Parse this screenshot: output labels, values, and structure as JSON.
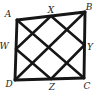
{
  "figure": {
    "kind": "geometry-diagram",
    "background_color": "#ffffff",
    "stroke_color": "#161616",
    "label_color": "#1c1c1c",
    "style": {
      "side_width": 2.9,
      "inner_width": 2.5
    },
    "points": {
      "A": {
        "label": "A",
        "x": 17,
        "y": 20,
        "label_x": 8,
        "label_y": 14
      },
      "B": {
        "label": "B",
        "x": 85,
        "y": 12,
        "label_x": 89,
        "label_y": 7
      },
      "C": {
        "label": "C",
        "x": 84,
        "y": 78,
        "label_x": 87,
        "label_y": 86
      },
      "D": {
        "label": "D",
        "x": 15,
        "y": 80,
        "label_x": 9,
        "label_y": 84
      },
      "X": {
        "label": "X",
        "x": 51,
        "y": 16,
        "label_x": 51,
        "label_y": 10
      },
      "Y": {
        "label": "Y",
        "x": 84.5,
        "y": 45,
        "label_x": 90,
        "label_y": 47
      },
      "Z": {
        "label": "Z",
        "x": 51,
        "y": 79,
        "label_x": 52,
        "label_y": 87
      },
      "W": {
        "label": "W",
        "x": 16,
        "y": 49,
        "label_x": 4,
        "label_y": 46
      }
    },
    "segments": [
      {
        "from": "A",
        "to": "B",
        "role": "side"
      },
      {
        "from": "B",
        "to": "C",
        "role": "side"
      },
      {
        "from": "C",
        "to": "D",
        "role": "side"
      },
      {
        "from": "D",
        "to": "A",
        "role": "side"
      },
      {
        "from": "A",
        "to": "C",
        "role": "diagonal"
      },
      {
        "from": "B",
        "to": "D",
        "role": "diagonal"
      },
      {
        "from": "W",
        "to": "X",
        "role": "midsegment"
      },
      {
        "from": "X",
        "to": "Y",
        "role": "midsegment"
      },
      {
        "from": "Y",
        "to": "Z",
        "role": "midsegment"
      },
      {
        "from": "Z",
        "to": "W",
        "role": "midsegment"
      }
    ]
  }
}
